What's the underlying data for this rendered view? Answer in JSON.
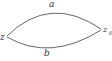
{
  "diagram": {
    "type": "contour-paths",
    "points": {
      "start": {
        "label": "z"
      },
      "end": {
        "label": "z",
        "subscript": "0"
      }
    },
    "paths": [
      {
        "label": "a",
        "position": "upper"
      },
      {
        "label": "b",
        "position": "lower"
      }
    ],
    "stroke_color": "#555555"
  }
}
